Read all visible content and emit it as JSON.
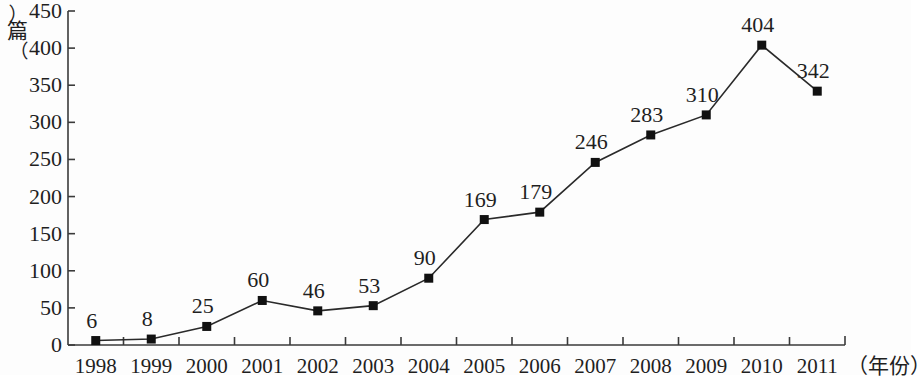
{
  "chart_data": {
    "type": "line",
    "title": "",
    "subtitle": "",
    "xlabel": "（年份）",
    "ylabel": "（篇）",
    "categories": [
      "1998",
      "1999",
      "2000",
      "2001",
      "2002",
      "2003",
      "2004",
      "2005",
      "2006",
      "2007",
      "2008",
      "2009",
      "2010",
      "2011"
    ],
    "values": [
      6,
      8,
      25,
      60,
      46,
      53,
      90,
      169,
      179,
      246,
      283,
      310,
      404,
      342
    ],
    "point_labels": [
      "6",
      "8",
      "25",
      "60",
      "46",
      "53",
      "90",
      "169",
      "179",
      "246",
      "283",
      "310",
      "404",
      "342"
    ],
    "ylim": [
      0,
      450
    ],
    "yticks": [
      0,
      50,
      100,
      150,
      200,
      250,
      300,
      350,
      400,
      450
    ],
    "ytick_labels": [
      "0",
      "50",
      "100",
      "150",
      "200",
      "250",
      "300",
      "350",
      "400",
      "450"
    ],
    "grid": false,
    "legend": null,
    "legend_position": "none",
    "series": [
      {
        "name": "",
        "values": [
          6,
          8,
          25,
          60,
          46,
          53,
          90,
          169,
          179,
          246,
          283,
          310,
          404,
          342
        ],
        "marker": "square",
        "marker_color": "#111111",
        "line_color": "#2a2a2a"
      }
    ],
    "colors": {
      "line": "#2a2a2a",
      "marker": "#111111",
      "axis": "#3a3a3a",
      "text": "#1f1f1f",
      "background": "#fdfdfd"
    }
  },
  "axes": {
    "y_unit_paren_open": "︵",
    "y_unit_char": "篇",
    "y_unit_paren_close": "︶",
    "x_unit": "（年份）"
  }
}
